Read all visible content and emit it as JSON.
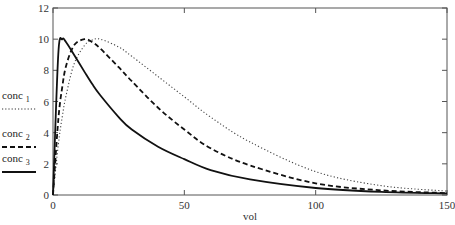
{
  "chart_data": {
    "type": "line",
    "title": "",
    "xlabel": "vol",
    "ylabel": "",
    "xlim": [
      0,
      150
    ],
    "ylim": [
      0,
      12
    ],
    "xticks": [
      0,
      50,
      100,
      150
    ],
    "yticks": [
      0,
      2,
      4,
      6,
      8,
      10,
      12
    ],
    "grid": false,
    "legend_position": "left-outside",
    "x": [
      0,
      2,
      3.5,
      5,
      8,
      12,
      15,
      18,
      25,
      30,
      40,
      50,
      60,
      75,
      100,
      125,
      150
    ],
    "series": [
      {
        "name": "conc 1",
        "label_base": "conc",
        "label_sub": "1",
        "style": "dotted",
        "values": [
          0,
          3.2,
          5.0,
          6.4,
          8.4,
          9.6,
          9.95,
          10.0,
          9.5,
          8.9,
          7.6,
          6.3,
          5.0,
          3.4,
          1.5,
          0.6,
          0.25
        ]
      },
      {
        "name": "conc 2",
        "label_base": "conc",
        "label_sub": "2",
        "style": "dashed",
        "values": [
          0,
          4.8,
          6.9,
          8.3,
          9.6,
          10.0,
          9.8,
          9.4,
          8.2,
          7.3,
          5.6,
          4.2,
          3.0,
          1.9,
          0.75,
          0.3,
          0.12
        ]
      },
      {
        "name": "conc 3",
        "label_base": "conc",
        "label_sub": "3",
        "style": "solid",
        "values": [
          0,
          9.0,
          10.0,
          9.8,
          9.0,
          7.9,
          7.1,
          6.4,
          5.0,
          4.2,
          3.1,
          2.3,
          1.6,
          1.0,
          0.45,
          0.2,
          0.1
        ]
      }
    ]
  },
  "legend": [
    {
      "base": "conc",
      "sub": "1"
    },
    {
      "base": "conc",
      "sub": "2"
    },
    {
      "base": "conc",
      "sub": "3"
    }
  ]
}
